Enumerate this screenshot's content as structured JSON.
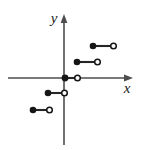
{
  "figure": {
    "background_color": "#ffffff",
    "stroke_color": "#262626",
    "axis_color": "#4d4d4d"
  },
  "axes": {
    "x_axis": {
      "label": "x",
      "label_x": 127,
      "label_y": 93,
      "start_x": 8,
      "end_x": 133,
      "y": 78,
      "arrow": "right"
    },
    "y_axis": {
      "label": "y",
      "label_x": 54,
      "label_y": 23,
      "x": 64,
      "start_y": 145,
      "end_y": 14,
      "arrow": "up"
    },
    "origin": {
      "x": 64,
      "y": 78
    }
  },
  "chart_data": {
    "type": "line",
    "xlabel": "x",
    "ylabel": "y",
    "grid": false,
    "legend": null,
    "xlim": [
      -4,
      5
    ],
    "ylim": [
      -3,
      3
    ],
    "origin_px": {
      "x": 64,
      "y": 78
    },
    "px_per_unit_x": 15,
    "px_per_unit_y": 16,
    "series": [
      {
        "name": "step-segments",
        "marker_start": "closed-circle",
        "marker_end": "open-circle",
        "segments": [
          {
            "id": "segment-1",
            "x_start": -2,
            "x_end": -1,
            "y": -2,
            "px": {
              "x1": 32,
              "x2": 50,
              "y": 110
            },
            "left_endpoint": "closed",
            "right_endpoint": "open"
          },
          {
            "id": "segment-2",
            "x_start": -1,
            "x_end": 0,
            "y": -1,
            "px": {
              "x1": 47,
              "x2": 65,
              "y": 93
            },
            "left_endpoint": "closed",
            "right_endpoint": "open"
          },
          {
            "id": "segment-3",
            "x_start": 0,
            "x_end": 1,
            "y": 0,
            "px": {
              "x1": 64,
              "x2": 78,
              "y": 78
            },
            "left_endpoint": "closed",
            "right_endpoint": "open"
          },
          {
            "id": "segment-4",
            "x_start": 1,
            "x_end": 2,
            "y": 1,
            "px": {
              "x1": 76,
              "x2": 98,
              "y": 62
            },
            "left_endpoint": "closed",
            "right_endpoint": "open"
          },
          {
            "id": "segment-5",
            "x_start": 2,
            "x_end": 3,
            "y": 2,
            "px": {
              "x1": 92,
              "x2": 114,
              "y": 46
            },
            "left_endpoint": "closed",
            "right_endpoint": "open"
          }
        ]
      }
    ]
  }
}
